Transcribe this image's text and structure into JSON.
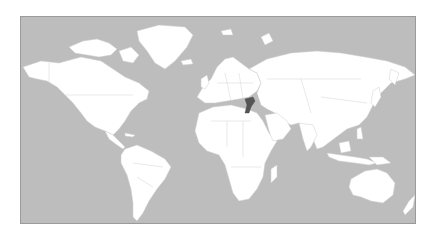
{
  "map": {
    "type": "world-locator-map",
    "projection": "equirectangular-like",
    "colors": {
      "ocean": "#bdbdbd",
      "land": "#ffffff",
      "borders": "#cfcfcf",
      "highlight": "#555555",
      "frame": "#9a9a9a"
    },
    "highlighted_region": "Syria / Jordan area (Middle East)",
    "labels": []
  }
}
